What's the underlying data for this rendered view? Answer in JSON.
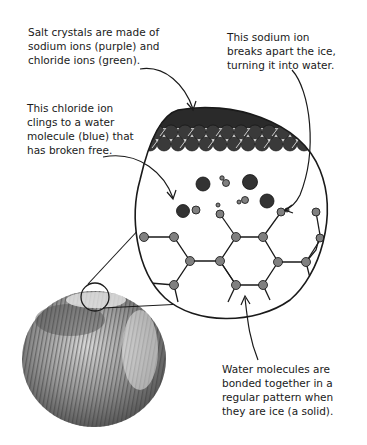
{
  "diagram": {
    "labels": {
      "salt_crystals": {
        "lines": [
          "Salt crystals are made of",
          "sodium ions (purple) and",
          "chloride ions (green)."
        ]
      },
      "sodium_ion": {
        "lines": [
          "This sodium ion",
          "breaks apart the ice,",
          "turning it into water."
        ]
      },
      "chloride_ion": {
        "lines": [
          "This chloride ion",
          "clings to a water",
          "molecule (blue) that",
          "has broken free."
        ]
      },
      "water_molecules": {
        "lines": [
          "Water molecules are",
          "bonded together in a",
          "regular pattern when",
          "they are ice (a solid)."
        ]
      }
    },
    "elements": {
      "magnified_view": "zoom circle showing salt layer, free ions, and ice lattice",
      "ice_sphere": "photo of ice ball with salt",
      "magnifier_loop": "small circle on top of ice sphere"
    },
    "colors": {
      "ink": "#1a1a1a",
      "salt_ion": "#333333",
      "water_node": "#808080"
    }
  }
}
